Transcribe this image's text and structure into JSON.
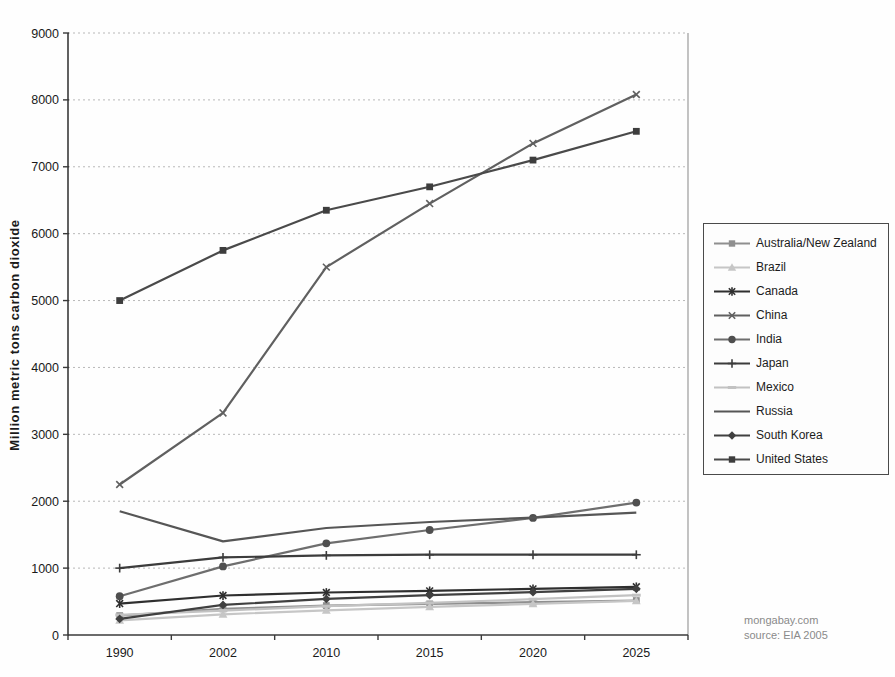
{
  "page": {
    "background": "#fefefe"
  },
  "watermark": {
    "line1": "mongabay.com",
    "line2": "source: EIA 2005"
  },
  "colors": {
    "grid": "#b8b8b8",
    "axis": "#3a3a3a",
    "plot_border": "#9a9a9a",
    "tick_text": "#1a1a1a",
    "legend_border": "#4a4a4a",
    "watermark_text": "#8a8a8a"
  },
  "chart_data": {
    "type": "line",
    "title": "",
    "xlabel": "",
    "ylabel": "Million metric tons carbon dioxide",
    "categories": [
      "1990",
      "2002",
      "2010",
      "2015",
      "2020",
      "2025"
    ],
    "ylim": [
      0,
      9000
    ],
    "ytick_step": 1000,
    "grid": "horizontal dotted",
    "legend_position": "right",
    "units": "million metric tons CO2",
    "series": [
      {
        "name": "Australia/New Zealand",
        "marker": "square",
        "color": "#8f8f8f",
        "values": [
          290,
          390,
          440,
          465,
          490,
          515
        ]
      },
      {
        "name": "Brazil",
        "marker": "triangle",
        "color": "#c6c6c6",
        "values": [
          220,
          310,
          370,
          420,
          465,
          510
        ]
      },
      {
        "name": "Canada",
        "marker": "star",
        "color": "#2f2f2f",
        "values": [
          470,
          590,
          635,
          660,
          690,
          720
        ]
      },
      {
        "name": "China",
        "marker": "x",
        "color": "#606060",
        "values": [
          2250,
          3320,
          5500,
          6450,
          7350,
          8080
        ]
      },
      {
        "name": "India",
        "marker": "circle",
        "color": "#6e6e6e",
        "marker_color": "#4f4f4f",
        "values": [
          580,
          1025,
          1370,
          1570,
          1750,
          1980
        ]
      },
      {
        "name": "Japan",
        "marker": "plus",
        "color": "#3c3c3c",
        "values": [
          1000,
          1160,
          1190,
          1200,
          1200,
          1200
        ]
      },
      {
        "name": "Mexico",
        "marker": "dash",
        "color": "#c2c2c2",
        "values": [
          300,
          365,
          430,
          480,
          535,
          595
        ]
      },
      {
        "name": "Russia",
        "marker": "none",
        "color": "#565656",
        "values": [
          1850,
          1400,
          1600,
          1690,
          1755,
          1830
        ]
      },
      {
        "name": "South Korea",
        "marker": "diamond",
        "color": "#404040",
        "values": [
          240,
          450,
          540,
          595,
          640,
          690
        ]
      },
      {
        "name": "United States",
        "marker": "square",
        "color": "#4a4a4a",
        "marker_color": "#3d3d3d",
        "values": [
          5000,
          5750,
          6350,
          6700,
          7100,
          7530
        ]
      }
    ]
  }
}
